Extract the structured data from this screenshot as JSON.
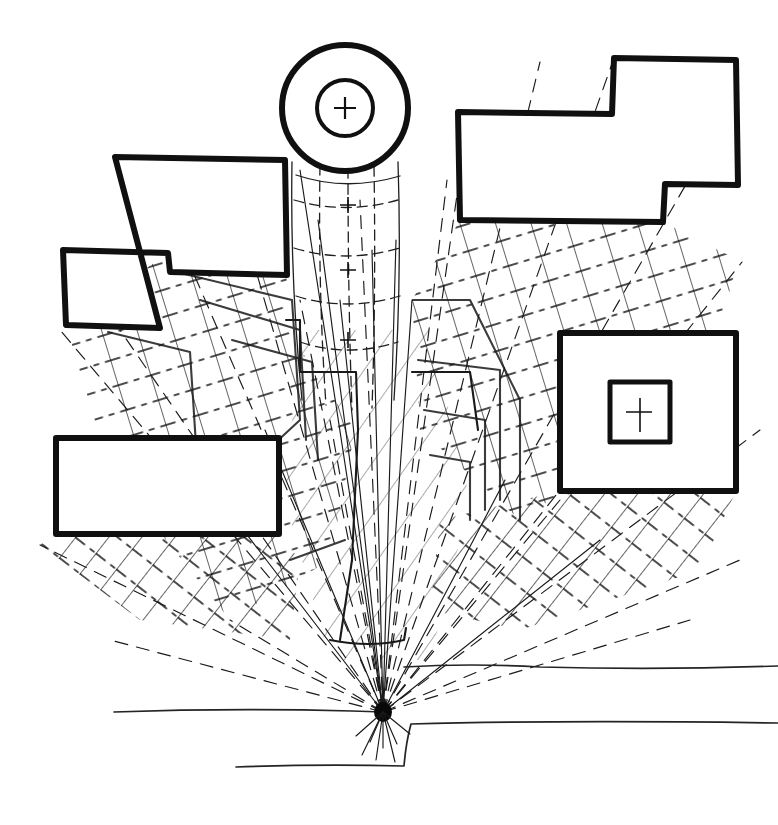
{
  "document": {
    "kind": "hand-drawn architectural shadow-projection study",
    "medium": "ink line drawing on white paper",
    "background_color": "#ffffff",
    "ink_color": "#101010",
    "width": 778,
    "height": 825,
    "has_text_labels": false
  },
  "light_source": {
    "name": "point-light-convergence",
    "label": "",
    "x": 383,
    "y": 712,
    "description": "dense ink blot where every shadow ray converges"
  },
  "masses": [
    {
      "id": "round-tower",
      "name": "round-tower",
      "shape": "circle",
      "cx": 345,
      "cy": 108,
      "r_outer": 63,
      "r_inner": 28,
      "has_center_cross": true,
      "stroke": "#101010"
    },
    {
      "id": "upper-left-block",
      "name": "upper-left-stepped-block",
      "shape": "stepped-polygon",
      "points": "115,157 285,160 287,275 170,272 168,253 63,250 66,325 160,328",
      "stroke": "#101010"
    },
    {
      "id": "upper-right-block",
      "name": "upper-right-stepped-block",
      "shape": "stepped-polygon",
      "points": "458,112 612,114 614,58 736,60 738,185 665,184 663,222 460,220",
      "stroke": "#101010"
    },
    {
      "id": "lower-left-block",
      "name": "lower-left-rectangle-block",
      "shape": "rectangle",
      "x": 56,
      "y": 438,
      "width": 223,
      "height": 96,
      "stroke": "#101010"
    },
    {
      "id": "right-courtyard-block",
      "name": "right-courtyard-square-block",
      "shape": "square-with-inner-court",
      "x": 560,
      "y": 333,
      "width": 176,
      "height": 158,
      "inner_x": 610,
      "inner_y": 382,
      "inner_width": 60,
      "inner_height": 60,
      "has_center_cross": true,
      "stroke": "#101010"
    }
  ],
  "ground_lines": [
    {
      "name": "ground-contour-upper",
      "path": "M 404 667 L 530 666 L 778 667"
    },
    {
      "name": "ground-contour-mid",
      "path": "M 236 767 L 405 766 L 410 724 L 778 723"
    },
    {
      "name": "ground-contour-lower",
      "path": "M 114 712 L 360 711 L 383 712"
    }
  ],
  "shadow_zones": [
    {
      "name": "shadow-upper-left",
      "hatch": "crosshatch",
      "source": "upper-left-stepped-block"
    },
    {
      "name": "shadow-upper-right",
      "hatch": "crosshatch",
      "source": "upper-right-stepped-block"
    },
    {
      "name": "shadow-lower-left",
      "hatch": "diagonal",
      "source": "lower-left-rectangle-block"
    },
    {
      "name": "shadow-right-court",
      "hatch": "diagonal",
      "source": "right-courtyard-block"
    },
    {
      "name": "shadow-tower-shaft",
      "hatch": "curved-bands",
      "source": "round-tower"
    }
  ],
  "ray_count": 26,
  "hatch": {
    "solid_line_color": "#111111",
    "dashed_line_color": "#1a1a1a",
    "style_note": "solid diagonals crossed by horizontal dash-dot lines"
  }
}
